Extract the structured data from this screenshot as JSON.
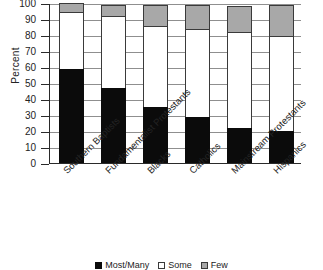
{
  "chart_data": {
    "type": "bar",
    "stacked": true,
    "title": "",
    "xlabel": "",
    "ylabel": "Percent",
    "ylim": [
      0,
      100
    ],
    "yticks": [
      0,
      10,
      20,
      30,
      40,
      50,
      60,
      70,
      80,
      90,
      100
    ],
    "grid": true,
    "legend_position": "bottom",
    "categories": [
      "Southern Baptists",
      "Fundamentalist Protestants",
      "Blacks",
      "Catholics",
      "Mainstream Protestants",
      "Hispanics"
    ],
    "series": [
      {
        "name": "Most/Many",
        "color": "#0b0b0b",
        "values": [
          59,
          47,
          35,
          29,
          22,
          20
        ]
      },
      {
        "name": "Some",
        "color": "#ffffff",
        "values": [
          35,
          44,
          50,
          54,
          59,
          59
        ]
      },
      {
        "name": "Few",
        "color": "#a8a8a8",
        "values": [
          6,
          8,
          14,
          16,
          17,
          20
        ]
      }
    ]
  },
  "axis": {
    "y_title": "Percent"
  },
  "legend": {
    "items": [
      {
        "label": "Most/Many",
        "swatch": "black-square-icon"
      },
      {
        "label": "Some",
        "swatch": "white-square-icon"
      },
      {
        "label": "Few",
        "swatch": "gray-square-icon"
      }
    ]
  }
}
